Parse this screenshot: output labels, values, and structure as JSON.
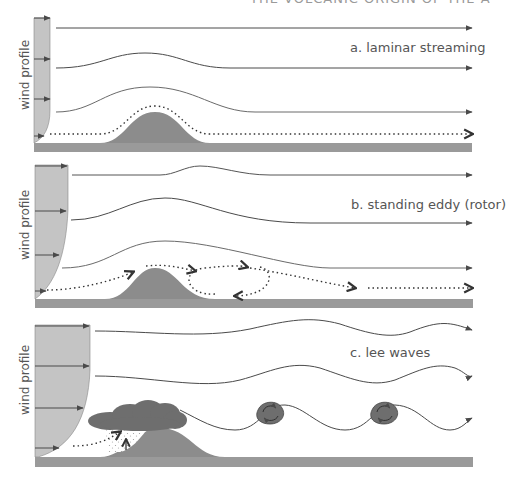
{
  "header": {
    "title_partial": "THE VOLCANIC ORIGIN OF THE ATMOSPHERE"
  },
  "panels": [
    {
      "id": "a",
      "label": "a. laminar streaming",
      "axis_label": "wind profile",
      "flow": "laminar streamlines follow terrain, smoothing with height"
    },
    {
      "id": "b",
      "label": "b. standing eddy (rotor)",
      "axis_label": "wind profile",
      "flow": "standing rotor eddy forms on lee side of hill"
    },
    {
      "id": "c",
      "label": "c. lee waves",
      "axis_label": "wind profile",
      "flow": "lee waves downstream with cap cloud over hill and rotor clouds under wave troughs"
    }
  ],
  "colors": {
    "ground": "#9a9a9a",
    "hill": "#8c8c8c",
    "profile_fill": "#c4c4c4",
    "streamline": "#4a4a4a",
    "cloud": "#6e6e6e",
    "text": "#555555"
  }
}
